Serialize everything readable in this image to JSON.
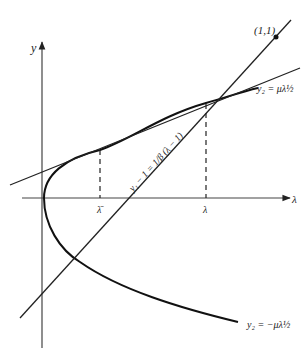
{
  "diagram": {
    "axes": {
      "y_label": "y",
      "x_label": "λ"
    },
    "points": {
      "intersection_label": "(1,1)"
    },
    "curves": {
      "upper_branch_label": "y₂ = μλ½",
      "lower_branch_label": "y₂ = −μλ½",
      "line_label": "y₁ − 1 = 1/β (λ − 1)"
    },
    "ticks": {
      "lambda_bar": "λ̄",
      "lambda": "λ"
    },
    "colors": {
      "stroke": "#222222",
      "background": "#ffffff"
    }
  }
}
